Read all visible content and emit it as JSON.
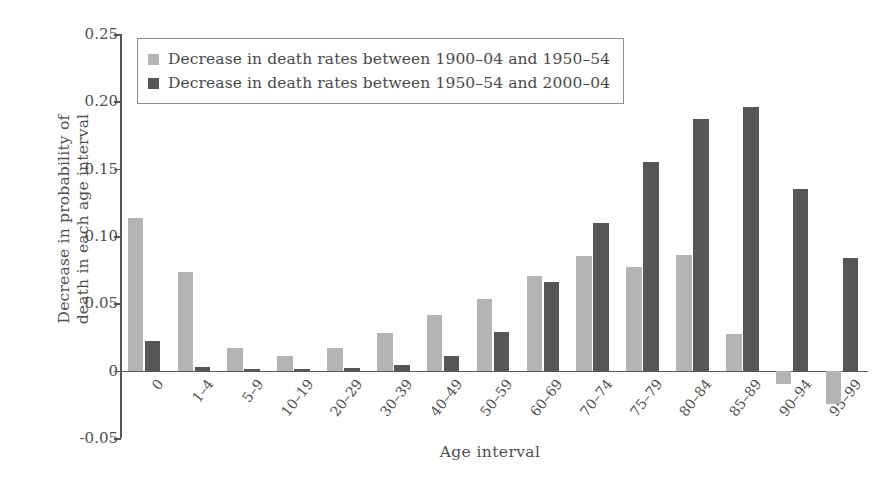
{
  "chart_data": {
    "type": "bar",
    "title": "",
    "xlabel": "Age interval",
    "ylabel": "Decrease in probability of\ndeath in each age interval",
    "ylim": [
      -0.05,
      0.25
    ],
    "yticks": [
      0.25,
      0.2,
      0.15,
      0.1,
      0.05,
      0,
      -0.05
    ],
    "ytick_labels": [
      "0.25",
      "0.20",
      "0.15",
      "0.10",
      "0.05",
      "0",
      "-0.05"
    ],
    "grid": false,
    "legend_position": "upper-left-inside",
    "categories": [
      "0",
      "1–4",
      "5–9",
      "10–19",
      "20–29",
      "30–39",
      "40–49",
      "50–59",
      "60–69",
      "70–74",
      "75–79",
      "80–84",
      "85–89",
      "90–94",
      "95–99"
    ],
    "series": [
      {
        "name": "Decrease in death rates between 1900–04 and 1950–54",
        "color": "#b4b4b4",
        "values": [
          0.113,
          0.073,
          0.017,
          0.011,
          0.017,
          0.028,
          0.041,
          0.053,
          0.07,
          0.085,
          0.077,
          0.086,
          0.027,
          -0.01,
          -0.025
        ]
      },
      {
        "name": "Decrease in death rates between 1950–54 and 2000–04",
        "color": "#565656",
        "values": [
          0.022,
          0.003,
          0.001,
          0.001,
          0.002,
          0.004,
          0.011,
          0.029,
          0.066,
          0.11,
          0.155,
          0.187,
          0.196,
          0.135,
          0.084
        ]
      }
    ]
  },
  "legend": {
    "entries": [
      {
        "label": "Decrease in death rates between 1900–04 and 1950–54",
        "swatch": "light"
      },
      {
        "label": "Decrease in death rates between 1950–54 and 2000–04",
        "swatch": "dark"
      }
    ]
  },
  "axes": {
    "x_title": "Age interval",
    "y_title": "Decrease in probability of\ndeath in each age interval"
  },
  "colors": {
    "series_light": "#b4b4b4",
    "series_dark": "#565656",
    "axis": "#585858",
    "text": "#4f4f4f",
    "background": "#ffffff"
  }
}
